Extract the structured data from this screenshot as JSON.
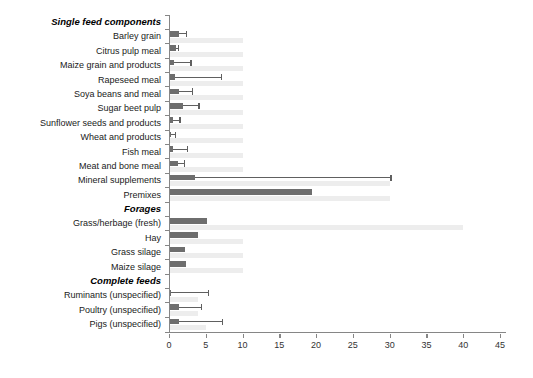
{
  "colors": {
    "dark_bar": "#6e6e6e",
    "light_bar": "#ededed",
    "error_bar": "#606060",
    "axis": "#868686",
    "label_text": "#1a1a1a"
  },
  "chart_data": {
    "type": "bar",
    "orientation": "horizontal",
    "title": "",
    "xlabel": "",
    "ylabel": "",
    "xlim": [
      0,
      45
    ],
    "x_ticks": [
      0,
      5,
      10,
      15,
      20,
      25,
      30,
      35,
      40,
      45
    ],
    "grid": false,
    "legend": "none",
    "series_meta": [
      {
        "name": "reported value (dark bar with upper error whisker)",
        "color": "#6e6e6e"
      },
      {
        "name": "secondary value (light bar)",
        "color": "#ededed"
      }
    ],
    "rows": [
      {
        "label": "Single feed components",
        "header": true
      },
      {
        "label": "Barley grain",
        "value": 1.4,
        "err_high": 2.5,
        "light": 10
      },
      {
        "label": "Citrus pulp meal",
        "value": 1.0,
        "err_high": 1.4,
        "light": 10
      },
      {
        "label": "Maize grain and  products",
        "value": 0.7,
        "err_high": 3.1,
        "light": 10
      },
      {
        "label": "Rapeseed meal",
        "value": 0.8,
        "err_high": 7.2,
        "light": 10
      },
      {
        "label": "Soya beans and  meal",
        "value": 1.4,
        "err_high": 3.3,
        "light": 10
      },
      {
        "label": "Sugar beet pulp",
        "value": 1.9,
        "err_high": 4.2,
        "light": 10
      },
      {
        "label": "Sunflower seeds and products",
        "value": 0.5,
        "err_high": 1.6,
        "light": 10
      },
      {
        "label": "Wheat and  products",
        "value": 0.3,
        "err_high": 1.0,
        "light": 10
      },
      {
        "label": "Fish meal",
        "value": 0.6,
        "err_high": 2.6,
        "light": 10
      },
      {
        "label": "Meat and bone meal",
        "value": 1.2,
        "err_high": 2.2,
        "light": 10
      },
      {
        "label": "Mineral supplements",
        "value": 3.5,
        "err_high": 30.3,
        "light": 30
      },
      {
        "label": "Premixes",
        "value": 19.5,
        "light": 30
      },
      {
        "label": "Forages",
        "header": true
      },
      {
        "label": "Grass/herbage (fresh)",
        "value": 5.2,
        "light": 40
      },
      {
        "label": "Hay",
        "value": 4.0,
        "light": 10
      },
      {
        "label": "Grass silage",
        "value": 2.2,
        "light": 10
      },
      {
        "label": "Maize silage",
        "value": 2.3,
        "light": 10
      },
      {
        "label": "Complete feeds",
        "header": true
      },
      {
        "label": "Ruminants (unspecified)",
        "value": 0.3,
        "err_high": 5.5,
        "light": 4
      },
      {
        "label": "Poultry (unspecified)",
        "value": 1.3,
        "err_high": 4.5,
        "light": 4
      },
      {
        "label": "Pigs (unspecified)",
        "value": 1.3,
        "err_high": 7.4,
        "light": 5
      }
    ]
  }
}
